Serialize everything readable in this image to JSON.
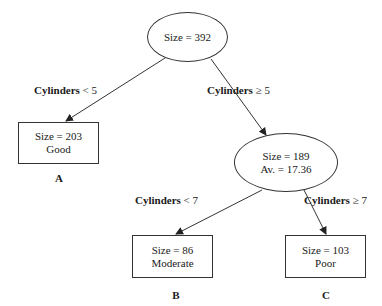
{
  "tree": {
    "root": {
      "size_text": "Size = 392"
    },
    "split1": {
      "left": {
        "var": "Cylinders",
        "op": "< 5"
      },
      "right": {
        "var": "Cylinders",
        "op": "≥ 5"
      }
    },
    "leaf_a": {
      "size_text": "Size = 203",
      "class": "Good",
      "tag": "A"
    },
    "internal": {
      "size_text": "Size = 189",
      "avg_text": "Av. = 17.36"
    },
    "split2": {
      "left": {
        "var": "Cylinders",
        "op": "< 7"
      },
      "right": {
        "var": "Cylinders",
        "op": "≥ 7"
      }
    },
    "leaf_b": {
      "size_text": "Size = 86",
      "class": "Moderate",
      "tag": "B"
    },
    "leaf_c": {
      "size_text": "Size = 103",
      "class": "Poor",
      "tag": "C"
    }
  }
}
